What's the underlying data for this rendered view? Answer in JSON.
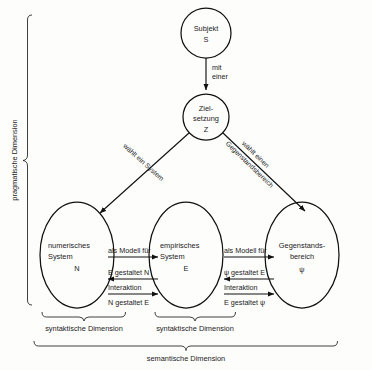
{
  "diagram": {
    "nodes": {
      "subjekt": {
        "line1": "Subjekt",
        "line2": "S"
      },
      "zielsetzung": {
        "line1": "Ziel-",
        "line2": "setzung",
        "line3": "Z"
      },
      "numerisches_system": {
        "line1": "numerisches",
        "line2": "System",
        "line3": "N"
      },
      "empirisches_system": {
        "line1": "empirisches",
        "line2": "System",
        "line3": "E"
      },
      "gegenstandsbereich": {
        "line1": "Gegenstands-",
        "line2": "bereich",
        "line3": "ψ"
      }
    },
    "edges": {
      "subjekt_to_ziel": {
        "line1": "mit",
        "line2": "einer"
      },
      "ziel_to_numerisch": {
        "line1": "wählt ein System"
      },
      "ziel_to_gegenstand": {
        "line1": "wählt einen",
        "line2": "Gegenstandsbereich"
      },
      "n_e_model": "als Modell für",
      "n_e_back": "E gestaltet N",
      "n_e_interaktion": "Interaktion",
      "n_e_forward": "N gestaltet E",
      "e_g_model": "als Modell für",
      "e_g_back": "ψ gestaltet E",
      "e_g_interaktion": "Interaktion",
      "e_g_forward": "E gestaltet ψ"
    },
    "dimensions": {
      "pragmatic": "pragmatische Dimension",
      "syntactic_left": "syntaktische Dimension",
      "syntactic_right": "syntaktische Dimension",
      "semantic": "semantische Dimension"
    },
    "colors": {
      "ink": "#111111",
      "paper": "#fdfdfc",
      "brace": "#2b2b2b"
    }
  }
}
